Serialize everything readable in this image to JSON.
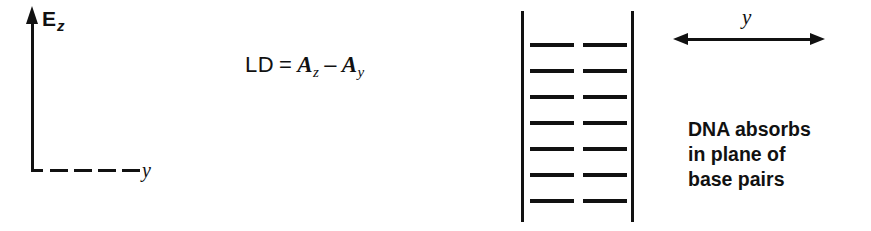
{
  "figure": {
    "width": 871,
    "height": 231,
    "background_color": "#ffffff",
    "ink_color": "#111111"
  },
  "coordinate_frame": {
    "vertical_axis": {
      "icon": "up-arrow-icon",
      "label_main": "E",
      "label_subscript": "z"
    },
    "horizontal_axis": {
      "style": "dashed",
      "dash_count": 4,
      "label": "y"
    }
  },
  "equation": {
    "lhs": "LD",
    "equals": "=",
    "term1_var": "A",
    "term1_sub": "z",
    "operator": "–",
    "term2_var": "A",
    "term2_sub": "y",
    "plain_text": "LD = A_z – A_y"
  },
  "dna_ladder": {
    "backbone_count": 2,
    "rung_rows": 7,
    "rung_pairs_per_row": 2,
    "row_spacing_px": 26,
    "first_row_y_px": 43,
    "description": "base-pair stack between two backbone strands"
  },
  "direction_arrow": {
    "icon": "double-headed-arrow-icon",
    "label": "y"
  },
  "caption": {
    "line1": "DNA absorbs",
    "line2": "in plane of",
    "line3": "base pairs"
  }
}
